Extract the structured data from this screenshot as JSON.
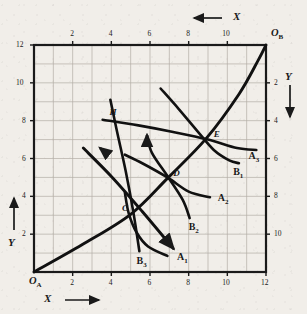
{
  "figure": {
    "kind": "edgeworth-box",
    "title": "",
    "background_color": "#f1eee9",
    "ink_color": "#1a1a1a",
    "grid_color": "#b3ada6"
  },
  "axes": {
    "bottom": {
      "name": "X",
      "arrow": "right",
      "origin_label": "O",
      "origin_sub": "A",
      "ticks": [
        "2",
        "4",
        "6",
        "8",
        "10",
        "12"
      ],
      "tick_values": [
        2,
        4,
        6,
        8,
        10,
        12
      ]
    },
    "top": {
      "name": "X",
      "arrow": "left",
      "origin_label": "O",
      "origin_sub": "B",
      "ticks": [
        "10",
        "8",
        "6",
        "4",
        "2"
      ],
      "tick_values": [
        10,
        8,
        6,
        4,
        2
      ]
    },
    "left": {
      "name": "Y",
      "arrow": "up",
      "ticks": [
        "12",
        "10",
        "8",
        "6",
        "4",
        "2"
      ],
      "tick_values": [
        12,
        10,
        8,
        6,
        4,
        2
      ]
    },
    "right": {
      "name": "Y",
      "arrow": "down",
      "ticks": [
        "2",
        "4",
        "6",
        "8",
        "10"
      ],
      "tick_values": [
        2,
        4,
        6,
        8,
        10
      ]
    },
    "xlim": [
      0,
      12
    ],
    "ylim": [
      0,
      12
    ],
    "grid": true,
    "grid_step": 1
  },
  "chart_data": {
    "type": "line",
    "title": "",
    "xlabel": "X",
    "ylabel": "Y",
    "xlim": [
      0,
      12
    ],
    "ylim": [
      0,
      12
    ],
    "grid": true,
    "legend": "inline-curve-labels",
    "series": [
      {
        "name": "A1",
        "label": "A₁",
        "label_text": "A",
        "label_sub": "1",
        "owner": "A",
        "points": [
          [
            4.7,
            4.2
          ],
          [
            4.9,
            3.1
          ],
          [
            5.3,
            2.1
          ],
          [
            5.9,
            1.35
          ],
          [
            6.9,
            0.85
          ]
        ],
        "label_pos": [
          7.4,
          0.75
        ]
      },
      {
        "name": "A2",
        "label": "A₂",
        "label_text": "A",
        "label_sub": "2",
        "owner": "A",
        "points": [
          [
            4.7,
            6.2
          ],
          [
            5.6,
            5.75
          ],
          [
            6.9,
            5.0
          ],
          [
            8.0,
            4.25
          ],
          [
            9.1,
            3.95
          ]
        ],
        "label_pos": [
          9.5,
          3.85
        ]
      },
      {
        "name": "A3",
        "label": "A₃",
        "label_text": "A",
        "label_sub": "3",
        "owner": "A",
        "points": [
          [
            3.55,
            8.05
          ],
          [
            5.4,
            7.75
          ],
          [
            7.2,
            7.4
          ],
          [
            9.0,
            7.0
          ],
          [
            10.5,
            6.55
          ],
          [
            11.5,
            6.45
          ]
        ],
        "label_pos": [
          11.1,
          6.1
        ]
      },
      {
        "name": "B1",
        "label": "B₁",
        "label_text": "B",
        "label_sub": "1",
        "owner": "B",
        "points": [
          [
            6.55,
            9.7
          ],
          [
            7.5,
            8.6
          ],
          [
            8.45,
            7.45
          ],
          [
            9.3,
            6.45
          ],
          [
            10.1,
            5.9
          ],
          [
            10.6,
            5.75
          ]
        ],
        "label_pos": [
          10.3,
          5.25
        ]
      },
      {
        "name": "B2",
        "label": "B₂",
        "label_text": "B",
        "label_sub": "2",
        "owner": "B",
        "points": [
          [
            5.85,
            7.2
          ],
          [
            6.1,
            6.3
          ],
          [
            6.95,
            5.0
          ],
          [
            7.7,
            3.8
          ],
          [
            8.05,
            2.85
          ]
        ],
        "label_pos": [
          8.0,
          2.3
        ]
      },
      {
        "name": "B3",
        "label": "B₃",
        "label_text": "B",
        "label_sub": "3",
        "owner": "B",
        "points": [
          [
            3.95,
            9.1
          ],
          [
            4.3,
            7.4
          ],
          [
            4.75,
            5.3
          ],
          [
            5.15,
            3.1
          ],
          [
            5.45,
            1.1
          ]
        ],
        "label_pos": [
          5.3,
          0.55
        ]
      },
      {
        "name": "contract-curve",
        "label": "",
        "label_text": "",
        "label_sub": "",
        "owner": "both",
        "points": [
          [
            0,
            0
          ],
          [
            2.5,
            1.45
          ],
          [
            5.0,
            3.05
          ],
          [
            6.9,
            4.95
          ],
          [
            8.9,
            7.05
          ],
          [
            10.6,
            9.4
          ],
          [
            11.6,
            11.2
          ],
          [
            12,
            12
          ]
        ],
        "label_pos": [
          0,
          0
        ]
      },
      {
        "name": "direction-line",
        "label": "",
        "label_text": "",
        "label_sub": "",
        "owner": "A",
        "points": [
          [
            2.55,
            6.55
          ],
          [
            4.05,
            5.0
          ],
          [
            5.6,
            3.2
          ],
          [
            7.2,
            1.25
          ]
        ],
        "label_pos": [
          0,
          0
        ]
      }
    ],
    "points": [
      {
        "label": "C",
        "x": 5.0,
        "y": 3.05,
        "label_pos": [
          4.55,
          3.3
        ]
      },
      {
        "label": "D",
        "x": 6.95,
        "y": 5.0,
        "label_pos": [
          7.2,
          5.15
        ]
      },
      {
        "label": "E",
        "x": 8.95,
        "y": 7.05,
        "label_pos": [
          9.3,
          7.2
        ]
      },
      {
        "label": "H",
        "x": 3.55,
        "y": 8.05,
        "label_pos": [
          3.9,
          8.35
        ]
      }
    ],
    "arrow_annotations": [
      {
        "name": "A2-preference-arrow",
        "at": [
          5.2,
          6.05
        ],
        "direction": "up-left"
      },
      {
        "name": "B2-preference-arrow",
        "at": [
          5.85,
          7.25
        ],
        "direction": "up"
      },
      {
        "name": "top-X-arrow",
        "direction": "left"
      },
      {
        "name": "bottom-X-arrow",
        "direction": "right"
      },
      {
        "name": "left-Y-arrow",
        "direction": "up"
      },
      {
        "name": "right-Y-arrow",
        "direction": "down"
      }
    ]
  }
}
